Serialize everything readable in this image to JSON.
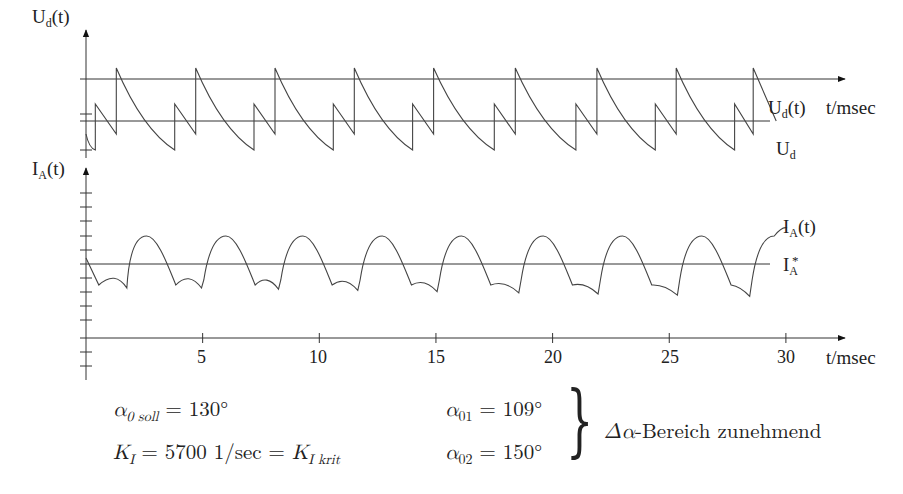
{
  "chart_data": [
    {
      "type": "line",
      "title": "",
      "ylabel": "U_d(t)",
      "xlabel": "t/msec",
      "x_unit": "msec",
      "xlim": [
        0,
        30.5
      ],
      "series": [
        {
          "name": "U_d(t)",
          "description": "sawtooth rectifier output voltage; alternating tall and short pulses, each a vertical rise followed by exponential-like decay"
        },
        {
          "name": "U_d",
          "description": "horizontal mean voltage reference line"
        }
      ],
      "peaks_tall_t_ms": [
        1.3,
        4.7,
        8.1,
        11.5,
        14.9,
        18.4,
        21.9,
        25.3,
        28.6
      ],
      "peaks_short_t_ms": [
        0.4,
        3.8,
        7.2,
        10.6,
        14.0,
        17.5,
        21.0,
        24.4,
        27.8
      ],
      "annotations": [
        "U_d(t)",
        "U_d",
        "t/msec"
      ]
    },
    {
      "type": "line",
      "title": "",
      "ylabel": "I_A(t)",
      "xlabel": "t/msec",
      "x_unit": "msec",
      "xticks": [
        5,
        10,
        15,
        20,
        25,
        30
      ],
      "xlim": [
        0,
        30.5
      ],
      "series": [
        {
          "name": "I_A(t)",
          "description": "armature current; periodic arcs above I_A* with double-dip troughs below, period ≈ 3.4 ms"
        },
        {
          "name": "I_A*",
          "description": "horizontal reference current line"
        }
      ],
      "arc_peak_t_ms": [
        2.6,
        6.0,
        9.3,
        12.7,
        16.1,
        19.6,
        23.0,
        26.4,
        29.5
      ],
      "annotations": [
        "I_A(t)",
        "I_A*",
        "t/msec"
      ]
    }
  ],
  "labels": {
    "upper_y_main": "U",
    "upper_y_sub": "d",
    "upper_y_tail": "(t)",
    "lower_y_main": "I",
    "lower_y_sub": "A",
    "lower_y_tail": "(t)",
    "ud_t_main": "U",
    "ud_t_sub": "d",
    "ud_t_tail": "(t)",
    "ud_main": "U",
    "ud_sub": "d",
    "ia_t_main": "I",
    "ia_t_sub": "A",
    "ia_t_tail": "(t)",
    "ia_star_main": "I",
    "ia_star_sub": "A",
    "ia_star_sup": "*",
    "x_unit_upper": "t/msec",
    "x_unit_lower": "t/msec",
    "xticks": [
      "5",
      "10",
      "15",
      "20",
      "25",
      "30"
    ]
  },
  "params": {
    "alpha_soll_sym": "α",
    "alpha_soll_sub": "0 soll",
    "alpha_soll_val": "= 130°",
    "ki_sym": "K",
    "ki_sub": "I",
    "ki_val": "= 5700 1/sec = ",
    "ki_krit_sym": "K",
    "ki_krit_sub": "I krit",
    "alpha01_sym": "α",
    "alpha01_sub": "01",
    "alpha01_val": "= 109°",
    "alpha02_sym": "α",
    "alpha02_sub": "02",
    "alpha02_val": "= 150°",
    "brace": "}",
    "range_delta": "Δα",
    "range_text": "-Bereich zunehmend"
  }
}
